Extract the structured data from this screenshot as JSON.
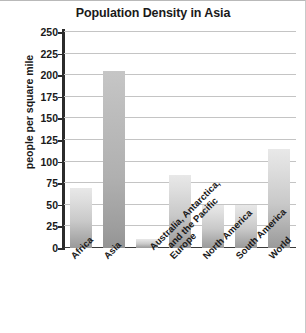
{
  "chart_data": {
    "type": "bar",
    "title": "Population Density in Asia",
    "xlabel": "",
    "ylabel": "people per square mile",
    "categories": [
      "Africa",
      "Asia",
      "Australia, Antarctica, and the Pacific",
      "Europe",
      "North America",
      "South America",
      "World"
    ],
    "values": [
      70,
      205,
      10,
      85,
      50,
      50,
      115
    ],
    "ylim": [
      0,
      250
    ],
    "yticks": [
      0,
      25,
      50,
      75,
      100,
      125,
      150,
      175,
      200,
      225,
      250
    ],
    "ytick_labels": [
      "0",
      "25",
      "50",
      "75",
      "100",
      "125",
      "150",
      "175",
      "200",
      "225",
      "250"
    ],
    "grid": true,
    "legend": false
  },
  "axis": {
    "y_title": "people per square mile"
  },
  "labels": {
    "africa": "Africa",
    "asia": "Asia",
    "australia_line1": "Australia, Antarctica,",
    "australia_line2": "and the Pacific",
    "europe": "Europe",
    "north_america": "North America",
    "south_america": "South America",
    "world": "World"
  },
  "colors": {
    "bar_top": "#e8e8e8",
    "bar_bottom": "#9a9a9a",
    "bar_dark_top": "#c6c6c6",
    "bar_dark_bottom": "#949494",
    "axis": "#2b2b2b",
    "gridline": "#c4c4c4",
    "text": "#1a1a1a",
    "background": "#ffffff"
  }
}
